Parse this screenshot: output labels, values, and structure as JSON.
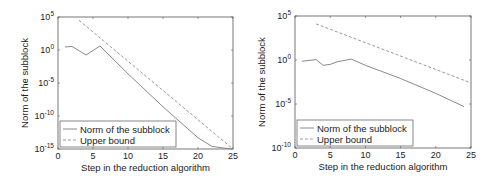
{
  "chart_data": [
    {
      "type": "line",
      "title": "",
      "xlabel": "Step in the reduction algorithm",
      "ylabel": "Norm of the subblock",
      "yscale": "log",
      "xlim": [
        0,
        25
      ],
      "ylim_exp": [
        -15,
        5
      ],
      "x_ticks": [
        0,
        5,
        10,
        15,
        20,
        25
      ],
      "y_ticks_exp": [
        5,
        0,
        -5,
        -10,
        -15
      ],
      "grid": false,
      "legend_position": "lower left",
      "box": {
        "x0": 58,
        "y0": 17,
        "x1": 233,
        "y1": 149
      },
      "series": [
        {
          "name": "Norm of the subblock",
          "style": "solid",
          "color": "#8a8a8a",
          "x": [
            1,
            2,
            4,
            6,
            8,
            10,
            15,
            20,
            22,
            24,
            25
          ],
          "log10_y": [
            0.45,
            0.55,
            -0.75,
            0.6,
            -1.5,
            -3.6,
            -8.6,
            -13.3,
            -14.6,
            -14.9,
            -15.0
          ]
        },
        {
          "name": "Upper bound",
          "style": "dashed",
          "color": "#9a9a9a",
          "x": [
            3,
            25
          ],
          "log10_y": [
            4.5,
            -15.0
          ]
        }
      ]
    },
    {
      "type": "line",
      "title": "",
      "xlabel": "Step in the reduction algorithm",
      "ylabel": "Norm of the subblock",
      "yscale": "log",
      "xlim": [
        0,
        25
      ],
      "ylim_exp": [
        -10,
        5
      ],
      "x_ticks": [
        0,
        5,
        10,
        15,
        20,
        25
      ],
      "y_ticks_exp": [
        5,
        0,
        -5,
        -10
      ],
      "grid": false,
      "legend_position": "lower left",
      "box": {
        "x0": 295,
        "y0": 16,
        "x1": 471,
        "y1": 148
      },
      "series": [
        {
          "name": "Norm of the subblock",
          "style": "solid",
          "color": "#8a8a8a",
          "x": [
            1,
            3,
            4,
            5,
            6,
            8,
            10,
            15,
            20,
            24
          ],
          "log10_y": [
            -0.15,
            0.05,
            -0.6,
            -0.5,
            -0.2,
            0.1,
            -0.6,
            -2.1,
            -3.8,
            -5.3
          ]
        },
        {
          "name": "Upper bound",
          "style": "dashed",
          "color": "#9a9a9a",
          "x": [
            3,
            25
          ],
          "log10_y": [
            4.1,
            -2.6
          ]
        }
      ]
    }
  ]
}
